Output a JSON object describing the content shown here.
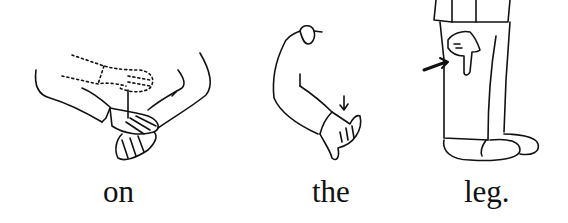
{
  "panels": [
    {
      "word": "on",
      "illustration": "two-hands-palm-on-back-of-hand-icon"
    },
    {
      "word": "the",
      "illustration": "arm-hand-twist-arrow-icon"
    },
    {
      "word": "leg.",
      "illustration": "finger-pointing-to-leg-icon"
    }
  ],
  "colors": {
    "ink": "#111111",
    "background": "#ffffff"
  }
}
